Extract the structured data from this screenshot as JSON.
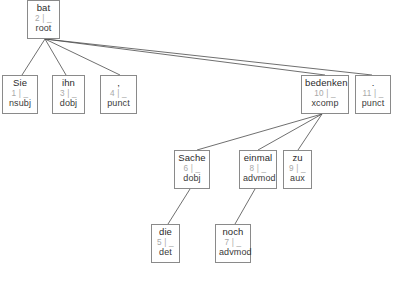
{
  "diagram": {
    "kind": "dependency-parse-tree",
    "sentence_tokens": [
      "Sie",
      "bat",
      "ihn",
      ",",
      "die",
      "Sache",
      "noch",
      "einmal",
      "zu",
      "bedenken",
      "."
    ],
    "separator": "|",
    "feature_placeholder": "_",
    "colors": {
      "node_border": "#8a8a8a",
      "node_background": "#ffffff",
      "word_text": "#2b2b2b",
      "index_text": "#a8a8a8",
      "relation_text": "#3a3a3a",
      "edge_line": "#4a4a4a"
    }
  },
  "caption": {
    "text": ""
  },
  "nodes": [
    {
      "id": "n2",
      "word": "bat",
      "index": "2 | _",
      "relation": "root",
      "x": 27,
      "y": 0,
      "w": 33,
      "h": 39
    },
    {
      "id": "n1",
      "word": "Sie",
      "index": "1 | _",
      "relation": "nsubj",
      "x": 2,
      "y": 75,
      "w": 36,
      "h": 39
    },
    {
      "id": "n3",
      "word": "ihn",
      "index": "3 | _",
      "relation": "dobj",
      "x": 52,
      "y": 75,
      "w": 33,
      "h": 39
    },
    {
      "id": "n4",
      "word": ",",
      "index": "4 | _",
      "relation": "punct",
      "x": 100,
      "y": 75,
      "w": 37,
      "h": 39
    },
    {
      "id": "n10",
      "word": "bedenken",
      "index": "10 | _",
      "relation": "xcomp",
      "x": 301,
      "y": 75,
      "w": 48,
      "h": 39
    },
    {
      "id": "n11",
      "word": ".",
      "index": "11 | _",
      "relation": "punct",
      "x": 355,
      "y": 75,
      "w": 36,
      "h": 39
    },
    {
      "id": "n6",
      "word": "Sache",
      "index": "6 | _",
      "relation": "dobj",
      "x": 174,
      "y": 150,
      "w": 36,
      "h": 39
    },
    {
      "id": "n8",
      "word": "einmal",
      "index": "8 | _",
      "relation": "advmod",
      "x": 239,
      "y": 150,
      "w": 38,
      "h": 39
    },
    {
      "id": "n9",
      "word": "zu",
      "index": "9 | _",
      "relation": "aux",
      "x": 283,
      "y": 150,
      "w": 29,
      "h": 39
    },
    {
      "id": "n5",
      "word": "die",
      "index": "5 | _",
      "relation": "det",
      "x": 151,
      "y": 224,
      "w": 29,
      "h": 39
    },
    {
      "id": "n7",
      "word": "noch",
      "index": "7 | _",
      "relation": "advmod",
      "x": 215,
      "y": 224,
      "w": 36,
      "h": 39
    }
  ],
  "edges": [
    {
      "from": "n2",
      "to": "n1",
      "x1": 45,
      "y1": 39,
      "x2": 22,
      "y2": 75
    },
    {
      "from": "n2",
      "to": "n3",
      "x1": 45,
      "y1": 39,
      "x2": 66,
      "y2": 75
    },
    {
      "from": "n2",
      "to": "n4",
      "x1": 45,
      "y1": 39,
      "x2": 120,
      "y2": 75
    },
    {
      "from": "n2",
      "to": "n10",
      "x1": 45,
      "y1": 39,
      "x2": 325,
      "y2": 75
    },
    {
      "from": "n2",
      "to": "n11",
      "x1": 45,
      "y1": 39,
      "x2": 372,
      "y2": 75
    },
    {
      "from": "n10",
      "to": "n6",
      "x1": 322,
      "y1": 114,
      "x2": 197,
      "y2": 150
    },
    {
      "from": "n10",
      "to": "n8",
      "x1": 322,
      "y1": 114,
      "x2": 258,
      "y2": 150
    },
    {
      "from": "n10",
      "to": "n9",
      "x1": 322,
      "y1": 114,
      "x2": 298,
      "y2": 150
    },
    {
      "from": "n6",
      "to": "n5",
      "x1": 190,
      "y1": 189,
      "x2": 168,
      "y2": 224
    },
    {
      "from": "n8",
      "to": "n7",
      "x1": 255,
      "y1": 189,
      "x2": 235,
      "y2": 224
    }
  ]
}
